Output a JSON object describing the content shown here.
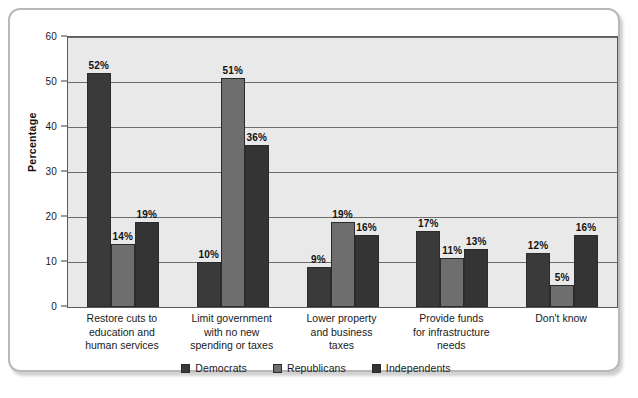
{
  "chart_data": {
    "type": "bar",
    "title": "",
    "subtitle": "",
    "xlabel": "",
    "ylabel": "Percentage",
    "ylim": [
      0,
      60
    ],
    "yticks": [
      0,
      10,
      20,
      30,
      40,
      50,
      60
    ],
    "ytick_labels": [
      "0",
      "10",
      "20",
      "30",
      "40",
      "50",
      "60"
    ],
    "grid": true,
    "legend_position": "bottom-center",
    "value_suffix": "%",
    "categories": [
      "Restore cuts to\neducation and\nhuman services",
      "Limit government\nwith no new\nspending or taxes",
      "Lower property\nand business\ntaxes",
      "Provide funds\nfor infrastructure\nneeds",
      "Don't know"
    ],
    "series": [
      {
        "name": "Democrats",
        "color": "#3a3a3a",
        "values": [
          52,
          10,
          9,
          17,
          12
        ],
        "labels": [
          "52%",
          "10%",
          "9%",
          "17%",
          "12%"
        ]
      },
      {
        "name": "Republicans",
        "color": "#6e6e6e",
        "values": [
          14,
          51,
          19,
          11,
          5
        ],
        "labels": [
          "14%",
          "51%",
          "19%",
          "11%",
          "5%"
        ]
      },
      {
        "name": "Independents",
        "color": "#343434",
        "values": [
          19,
          36,
          16,
          13,
          16
        ],
        "labels": [
          "19%",
          "36%",
          "16%",
          "13%",
          "16%"
        ]
      }
    ],
    "colors": {
      "plot_background": "#e9e9e9",
      "frame_border": "#b9b9b9",
      "gridline": "#6d6d6d",
      "axis": "#5a5a5a",
      "text": "#1a1a1a"
    }
  }
}
